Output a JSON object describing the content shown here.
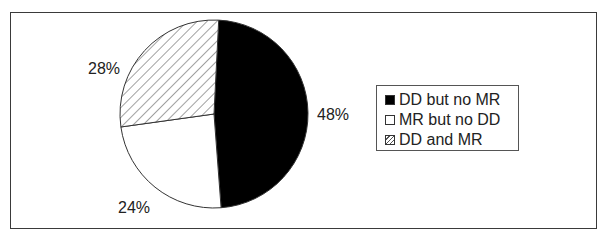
{
  "chart_data": {
    "type": "pie",
    "title": "",
    "slices": [
      {
        "label": "DD but no MR",
        "value": 48,
        "display": "48%",
        "fill": "#000000",
        "pattern": "solid"
      },
      {
        "label": "MR but no DD",
        "value": 24,
        "display": "24%",
        "fill": "#ffffff",
        "pattern": "solid"
      },
      {
        "label": "DD and MR",
        "value": 28,
        "display": "28%",
        "fill": "#ffffff",
        "pattern": "diagonal-hatch"
      }
    ],
    "legend": {
      "position": "right",
      "entries": [
        "DD but no MR",
        "MR but no DD",
        "DD and MR"
      ]
    },
    "start_angle_deg": 0,
    "direction": "clockwise"
  },
  "labels": {
    "dd_no_mr": "48%",
    "mr_no_dd": "24%",
    "dd_and_mr": "28%"
  },
  "legend": {
    "items": [
      {
        "label": "DD but no MR"
      },
      {
        "label": "MR but no DD"
      },
      {
        "label": "DD and MR"
      }
    ]
  }
}
